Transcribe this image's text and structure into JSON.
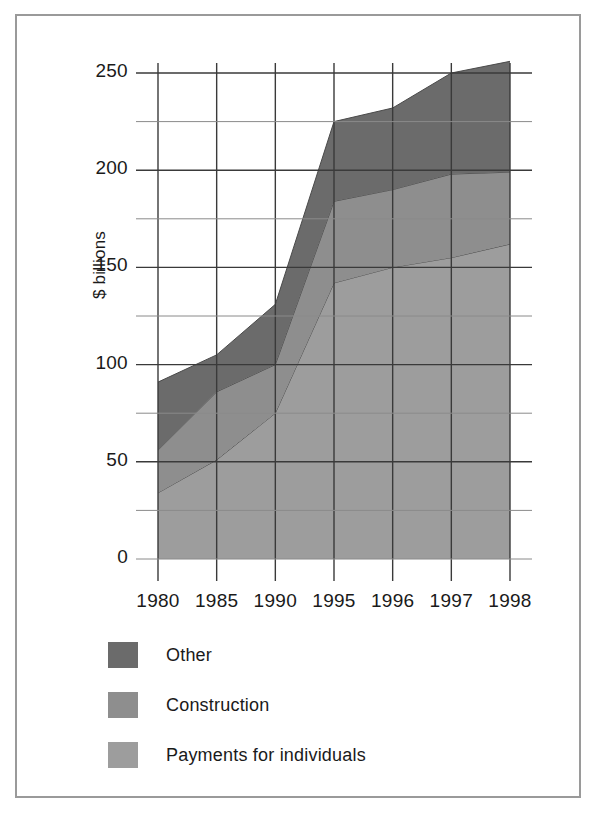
{
  "chart_data": {
    "type": "area",
    "stacked": true,
    "title": "",
    "xlabel": "",
    "ylabel": "$ billions",
    "categories": [
      "1980",
      "1985",
      "1990",
      "1995",
      "1996",
      "1997",
      "1998"
    ],
    "x_tick_labels": [
      "1980",
      "1985",
      "1990",
      "1995",
      "1996",
      "1997",
      "1998"
    ],
    "y_tick_labels": [
      "0",
      "50",
      "100",
      "150",
      "200",
      "250"
    ],
    "y_major_ticks": [
      0,
      50,
      100,
      150,
      200,
      250
    ],
    "y_minor_gridlines": [
      25,
      75,
      125,
      175,
      225
    ],
    "ylim": [
      0,
      265
    ],
    "grid": true,
    "legend_position": "below-plot-left",
    "series": [
      {
        "name": "Payments for individuals",
        "color": "#9d9d9d",
        "values": [
          34,
          51,
          75,
          142,
          150,
          155,
          162
        ]
      },
      {
        "name": "Construction",
        "color": "#8e8e8e",
        "values": [
          22,
          35,
          25,
          42,
          40,
          43,
          37
        ]
      },
      {
        "name": "Other",
        "color": "#6b6b6b",
        "values": [
          35,
          19,
          31,
          41,
          42,
          52,
          57
        ]
      }
    ],
    "stack_tops": {
      "payments_for_individuals": [
        34,
        51,
        75,
        142,
        150,
        155,
        162
      ],
      "construction": [
        56,
        86,
        100,
        184,
        190,
        198,
        199
      ],
      "other": [
        91,
        105,
        131,
        225,
        232,
        250,
        256
      ]
    }
  },
  "legend": {
    "items": [
      {
        "label": "Other",
        "color": "#6b6b6b"
      },
      {
        "label": "Construction",
        "color": "#8e8e8e"
      },
      {
        "label": "Payments for individuals",
        "color": "#9d9d9d"
      }
    ]
  },
  "axis": {
    "y_title": "$ billions"
  },
  "colors": {
    "frame": "#9a9a9a",
    "gridline_major": "#3a3a3a",
    "gridline_minor": "#8a8a8a",
    "text": "#1a1a1a",
    "background": "#ffffff"
  }
}
